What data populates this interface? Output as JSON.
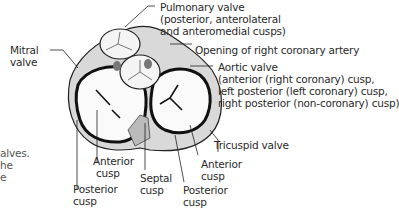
{
  "labels": {
    "pulmonary": [
      "Pulmonary valve",
      "(posterior, anterolateral",
      "and anteromedial cusps)"
    ],
    "coronary_opening": "Opening of right coronary artery",
    "aortic": [
      "Aortic valve",
      "(anterior (right coronary) cusp,",
      "left posterior (left coronary) cusp,",
      "right posterior (non-coronary) cusp)"
    ],
    "tricuspid": "Tricuspid valve",
    "mitral": [
      "Mitral",
      "valve"
    ],
    "mitral_anterior": [
      "Anterior",
      "cusp"
    ],
    "mitral_posterior": [
      "Posterior",
      "cusp"
    ],
    "septal": [
      "Septal",
      "cusp"
    ],
    "tricuspid_anterior": [
      "Anterior",
      "cusp"
    ],
    "tricuspid_posterior": [
      "Posterior",
      "cusp"
    ],
    "left_fragment": [
      "alves.",
      "he",
      "e"
    ]
  }
}
